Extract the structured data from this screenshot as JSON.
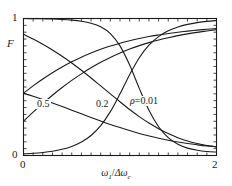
{
  "chart_data": {
    "type": "line",
    "title": "",
    "subtitle": "",
    "xlabel": "ω₁/Δω_c",
    "xlabel_parts": {
      "omega": "ω",
      "omega_sub": "1",
      "slash": "/",
      "delta_omega": "Δω",
      "delta_omega_sub": "c"
    },
    "ylabel": "F",
    "xlim": [
      0,
      2
    ],
    "ylim": [
      0,
      1
    ],
    "xticks": [
      0,
      2
    ],
    "xtick_labels": [
      "0",
      "2"
    ],
    "yticks": [
      0,
      1
    ],
    "ytick_labels": [
      "0",
      "1"
    ],
    "minor_ticks": true,
    "grid": false,
    "legend": "none",
    "annotations": [
      {
        "text": "0.5",
        "x": 0.16,
        "y": 0.45
      },
      {
        "text": "0.2",
        "x": 0.84,
        "y": 0.45
      },
      {
        "text": "ρ=0.01",
        "x": 1.23,
        "y": 0.48
      }
    ],
    "line_color": "#1a1a1a",
    "line_width": 1.1,
    "frame_color": "#1a1a1a",
    "background": "#ffffff",
    "x": [
      0,
      0.1,
      0.2,
      0.3,
      0.4,
      0.5,
      0.6,
      0.7,
      0.8,
      0.9,
      1.0,
      1.1,
      1.2,
      1.3,
      1.4,
      1.5,
      1.6,
      1.7,
      1.8,
      1.9,
      2.0
    ],
    "series": [
      {
        "name": "rho=0.01 descending",
        "rho": 0.01,
        "direction": "descending",
        "values": [
          1.0,
          0.999,
          0.998,
          0.996,
          0.993,
          0.988,
          0.98,
          0.966,
          0.94,
          0.89,
          0.8,
          0.66,
          0.49,
          0.33,
          0.21,
          0.13,
          0.082,
          0.054,
          0.038,
          0.029,
          0.025
        ]
      },
      {
        "name": "rho=0.2 descending",
        "rho": 0.2,
        "direction": "descending",
        "values": [
          0.885,
          0.85,
          0.812,
          0.77,
          0.724,
          0.675,
          0.622,
          0.566,
          0.508,
          0.45,
          0.392,
          0.336,
          0.284,
          0.237,
          0.196,
          0.16,
          0.13,
          0.106,
          0.087,
          0.073,
          0.063
        ]
      },
      {
        "name": "rho=0.5 descending",
        "rho": 0.5,
        "direction": "descending",
        "values": [
          0.455,
          0.432,
          0.408,
          0.383,
          0.357,
          0.331,
          0.304,
          0.278,
          0.252,
          0.227,
          0.204,
          0.182,
          0.161,
          0.143,
          0.126,
          0.111,
          0.098,
          0.087,
          0.078,
          0.07,
          0.064
        ]
      },
      {
        "name": "rho=0.5 ascending",
        "rho": 0.5,
        "direction": "ascending",
        "values": [
          0.455,
          0.508,
          0.558,
          0.604,
          0.646,
          0.684,
          0.718,
          0.748,
          0.775,
          0.799,
          0.82,
          0.838,
          0.854,
          0.868,
          0.88,
          0.891,
          0.9,
          0.908,
          0.915,
          0.921,
          0.926
        ]
      },
      {
        "name": "rho=0.2 ascending",
        "rho": 0.2,
        "direction": "ascending",
        "values": [
          0.25,
          0.316,
          0.38,
          0.44,
          0.496,
          0.548,
          0.596,
          0.64,
          0.68,
          0.716,
          0.748,
          0.777,
          0.802,
          0.824,
          0.843,
          0.86,
          0.875,
          0.888,
          0.899,
          0.909,
          0.918
        ]
      },
      {
        "name": "rho=0.01 ascending",
        "rho": 0.01,
        "direction": "ascending",
        "values": [
          0.012,
          0.016,
          0.022,
          0.031,
          0.045,
          0.066,
          0.098,
          0.146,
          0.218,
          0.32,
          0.45,
          0.59,
          0.714,
          0.805,
          0.868,
          0.91,
          0.938,
          0.957,
          0.97,
          0.979,
          0.985
        ]
      }
    ]
  },
  "axes": {
    "ytick_top": "1",
    "ytick_bottom": "0",
    "xtick_left": "0",
    "xtick_right": "2",
    "ylabel": "F"
  },
  "annotations": {
    "a0": "0.5",
    "a1": "0.2",
    "a2_rho": "ρ",
    "a2_eq": "=0.01"
  }
}
